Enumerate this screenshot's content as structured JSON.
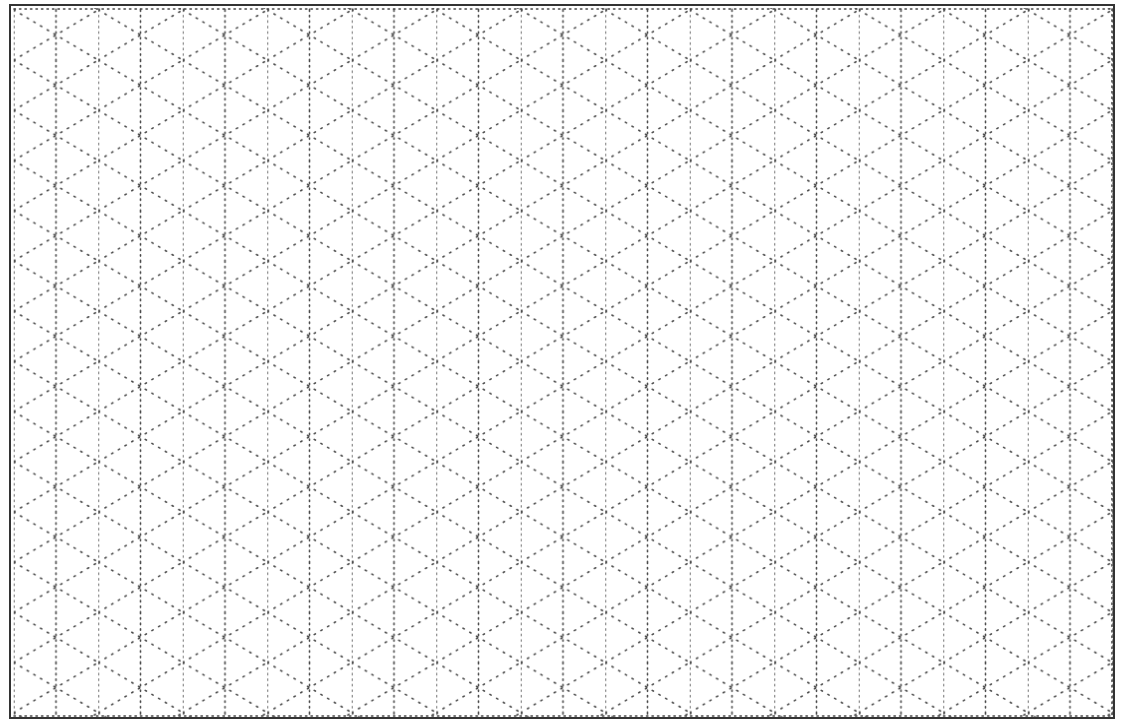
{
  "page": {
    "background_color": "#ffffff",
    "dot_color": "#4a4a4a",
    "border_color": "#333333"
  },
  "grid": {
    "type": "isometric-dotted",
    "vertical_line_count": 27,
    "vertical_spacing_px": 42.25,
    "diagonal_period_px": 50.2,
    "origin_x": 13.75,
    "origin_y": 9.9,
    "left": 14,
    "top": 9,
    "right": 1112,
    "bottom": 716
  }
}
